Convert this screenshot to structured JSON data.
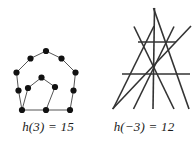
{
  "page": {
    "width": 192,
    "height": 145,
    "background": "#ffffff",
    "ink": "#1a1a1a"
  },
  "figures": [
    {
      "id": "pentagon-graph",
      "kind": "graph-diagram",
      "caption": {
        "function_name": "h",
        "argument": "(3)",
        "equals": "=",
        "value": "15",
        "full_text": "h(3) = 15"
      },
      "style": {
        "node_color": "#111111",
        "node_radius": 3.1,
        "edge_color": "#555555",
        "edge_width": 1.0
      },
      "nodes": [
        {
          "name": "outer-apex",
          "x": 46.0,
          "y": 51.0
        },
        {
          "name": "outer-upper-left",
          "x": 30.5,
          "y": 58.5
        },
        {
          "name": "outer-upper-right",
          "x": 61.5,
          "y": 58.5
        },
        {
          "name": "outer-left",
          "x": 16.5,
          "y": 72.5
        },
        {
          "name": "outer-right",
          "x": 75.5,
          "y": 72.5
        },
        {
          "name": "outer-left-mid",
          "x": 18.5,
          "y": 90.5
        },
        {
          "name": "outer-right-mid",
          "x": 73.5,
          "y": 90.5
        },
        {
          "name": "outer-bottom-left",
          "x": 22.0,
          "y": 110.0
        },
        {
          "name": "outer-bottom-mid",
          "x": 46.0,
          "y": 110.0
        },
        {
          "name": "outer-bottom-right",
          "x": 70.0,
          "y": 110.0
        },
        {
          "name": "inner-apex",
          "x": 41.5,
          "y": 77.5
        },
        {
          "name": "inner-left",
          "x": 28.0,
          "y": 88.0
        },
        {
          "name": "inner-right",
          "x": 55.0,
          "y": 87.0
        }
      ],
      "edges": [
        [
          "outer-apex",
          "outer-upper-left"
        ],
        [
          "outer-apex",
          "outer-upper-right"
        ],
        [
          "outer-upper-left",
          "outer-left"
        ],
        [
          "outer-upper-right",
          "outer-right"
        ],
        [
          "outer-left",
          "outer-left-mid"
        ],
        [
          "outer-right",
          "outer-right-mid"
        ],
        [
          "outer-left-mid",
          "outer-bottom-left"
        ],
        [
          "outer-right-mid",
          "outer-bottom-right"
        ],
        [
          "outer-bottom-left",
          "outer-bottom-mid"
        ],
        [
          "outer-bottom-mid",
          "outer-bottom-right"
        ],
        [
          "inner-apex",
          "inner-left"
        ],
        [
          "inner-apex",
          "inner-right"
        ],
        [
          "inner-left",
          "outer-bottom-left"
        ],
        [
          "inner-right",
          "outer-bottom-mid"
        ]
      ]
    },
    {
      "id": "triangle-lattice",
      "kind": "line-arrangement",
      "caption": {
        "function_name": "h",
        "argument": "(−3)",
        "equals": "=",
        "value": "12",
        "full_text": "h(−3) = 12"
      },
      "style": {
        "line_color": "#333333",
        "line_width": 1.6
      },
      "segments": [
        {
          "name": "left-diagonal-long",
          "x1": 57.0,
          "y1": 109.0,
          "x2": 58.5,
          "y2": 8.0
        },
        {
          "name": "right-diagonal-long",
          "x1": 93.0,
          "y1": 109.0,
          "x2": 57.5,
          "y2": 8.0
        },
        {
          "name": "left-diagonal-mid",
          "x1": 17.0,
          "y1": 109.0,
          "x2": 58.0,
          "y2": 26.0
        },
        {
          "name": "right-diagonal-mid",
          "x1": 78.0,
          "y1": 26.5,
          "x2": 37.5,
          "y2": 109.0
        },
        {
          "name": "left-diagonal-low",
          "x1": 38.0,
          "y1": 26.5,
          "x2": 78.0,
          "y2": 109.0
        },
        {
          "name": "right-diagonal-low",
          "x1": 95.0,
          "y1": 26.0,
          "x2": 16.5,
          "y2": 109.0
        },
        {
          "name": "horizontal-upper",
          "x1": 42.0,
          "y1": 42.0,
          "x2": 80.0,
          "y2": 42.0
        },
        {
          "name": "horizontal-lower",
          "x1": 26.0,
          "y1": 74.0,
          "x2": 94.0,
          "y2": 74.0
        }
      ]
    }
  ]
}
